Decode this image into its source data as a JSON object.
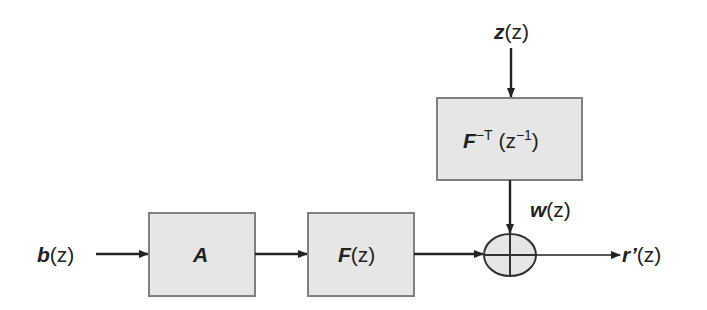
{
  "colors": {
    "box_fill": "#e6e6e6",
    "box_stroke": "#808080",
    "line": "#222222",
    "background": "#ffffff"
  },
  "input": {
    "b_sym": "b",
    "b_arg": "(z)",
    "z_sym": "z",
    "z_arg": "(z)"
  },
  "blocks": {
    "A": {
      "label": "A"
    },
    "F": {
      "sym": "F",
      "arg": "(z)"
    },
    "Finv": {
      "sym": "F",
      "sup": "−T",
      "arg_open": " (z",
      "arg_sup": "−1",
      "arg_close": ")"
    }
  },
  "signals": {
    "w_sym": "w",
    "w_arg": "(z)",
    "r_sym": "r’",
    "r_arg": "(z)"
  },
  "summer": {
    "icon": "plus-circle"
  }
}
